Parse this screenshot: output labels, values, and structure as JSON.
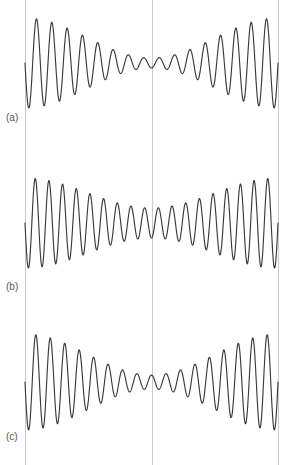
{
  "figure": {
    "width": 290,
    "height": 465,
    "background_color": "#ffffff",
    "trace_color": "#3a3a3a",
    "gridline_color": "#c9c9c9",
    "label_color": "#555555"
  },
  "labels": {
    "panel_a": "(a)",
    "panel_b": "(b)",
    "panel_c": "(c)"
  },
  "gridlines": {
    "left_x": 25,
    "center_x": 152,
    "right_x": 278
  },
  "chart_data": {
    "type": "line",
    "title": "",
    "xlabel": "",
    "ylabel": "",
    "grid": true,
    "legend": "none",
    "xlim": [
      25,
      278
    ],
    "x_gridline_positions": [
      25,
      152,
      278
    ],
    "panels": [
      {
        "label": "(a)",
        "baseline_y": 63,
        "cycles": 16.5,
        "phase_deg": 90,
        "envelope": {
          "type": "symmetric-beat",
          "edge_amplitude": 45,
          "center_amplitude": 5,
          "shape": "cosine-taper"
        },
        "peaks_left_half": 8,
        "peaks_right_half": 8,
        "ylim": [
          18,
          108
        ]
      },
      {
        "label": "(b)",
        "baseline_y": 223,
        "cycles": 18.5,
        "phase_deg": 90,
        "envelope": {
          "type": "symmetric-beat",
          "edge_amplitude": 45,
          "center_amplitude": 15,
          "shape": "cosine-taper"
        },
        "peaks_left_half": 9,
        "peaks_right_half": 9,
        "ylim": [
          178,
          268
        ]
      },
      {
        "label": "(c)",
        "baseline_y": 382,
        "cycles": 17.5,
        "phase_deg": 90,
        "envelope": {
          "type": "symmetric-beat",
          "edge_amplitude": 48,
          "center_amplitude": 7,
          "shape": "cosine-taper"
        },
        "peaks_left_half": 8,
        "peaks_right_half": 9,
        "ylim": [
          333,
          430
        ]
      }
    ]
  }
}
